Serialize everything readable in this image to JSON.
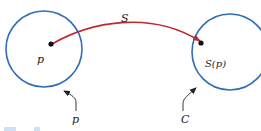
{
  "diagram": {
    "map_label": "S",
    "left_point_label": "p",
    "left_circle_label": "p",
    "right_point_label": "S(p)",
    "right_circle_label": "C",
    "colors": {
      "circle": "#2f6cb5",
      "arc": "#c0282d",
      "point": "#111111",
      "text": "#222222"
    }
  }
}
